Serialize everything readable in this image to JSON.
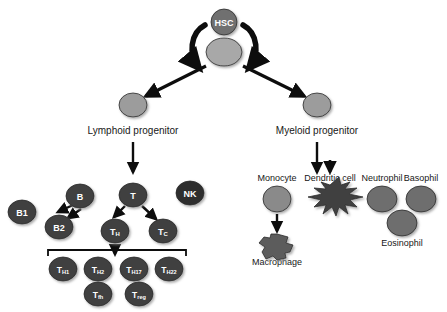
{
  "figure": {
    "background_color": "#ffffff",
    "palette": {
      "stem_gray": "#a8a8a8",
      "progenitor_gray": "#9c9c9c",
      "lymphoid_dark": "#3f3f3f",
      "myeloid_gray": "#8a8a8a",
      "granulocyte_gray": "#6e6e6e",
      "arrow_black": "#0d0d0d",
      "label_black": "#171717"
    }
  },
  "stem": {
    "hsc_label": "HSC",
    "hsc_badge": {
      "cx": 224,
      "cy": 22,
      "r": 13,
      "fill": "#6f6f6f",
      "text_fill": "#ffffff",
      "font_size": 9
    },
    "hsc_cell": {
      "cx": 224,
      "cy": 52,
      "rx": 18,
      "ry": 14,
      "fill": "#a8a8a8"
    },
    "self_renewal_arcs": [
      {
        "name": "self-renewal-arc-left",
        "d": "M 205 25 C 190 33, 188 55, 199 68"
      },
      {
        "name": "self-renewal-arc-right",
        "d": "M 243 25 C 258 33, 260 55, 249 68"
      }
    ]
  },
  "progenitors": [
    {
      "id": "lymphoid",
      "label": "Lymphoid progenitor",
      "cell": {
        "cx": 133,
        "cy": 105,
        "rx": 14,
        "ry": 12,
        "fill": "#9c9c9c"
      },
      "label_pos": {
        "x": 133,
        "y": 130,
        "font_size": 10
      },
      "feed_arrow": {
        "x1": 206,
        "y1": 66,
        "x2": 146,
        "y2": 96
      },
      "down_arrow": {
        "x1": 133,
        "y1": 142,
        "x2": 133,
        "y2": 172
      }
    },
    {
      "id": "myeloid",
      "label": "Myeloid progenitor",
      "cell": {
        "cx": 317,
        "cy": 105,
        "rx": 14,
        "ry": 12,
        "fill": "#9c9c9c"
      },
      "label_pos": {
        "x": 317,
        "y": 130,
        "font_size": 10
      },
      "feed_arrow": {
        "x1": 243,
        "y1": 66,
        "x2": 304,
        "y2": 96
      },
      "down_arrow": {
        "x1": 317,
        "y1": 142,
        "x2": 317,
        "y2": 172
      }
    }
  ],
  "lymphoid_cells": [
    {
      "id": "b1",
      "label": "B1",
      "sub": "",
      "cx": 22,
      "cy": 212,
      "rx": 14,
      "ry": 12,
      "fill": "#3f3f3f",
      "font_size": 9,
      "text_class": "light-text"
    },
    {
      "id": "b2",
      "label": "B2",
      "sub": "",
      "cx": 59,
      "cy": 227,
      "rx": 14,
      "ry": 12,
      "fill": "#3f3f3f",
      "font_size": 9,
      "text_class": "light-text"
    },
    {
      "id": "b",
      "label": "B",
      "sub": "",
      "cx": 80,
      "cy": 196,
      "rx": 14,
      "ry": 12,
      "fill": "#3f3f3f",
      "font_size": 9,
      "text_class": "light-text"
    },
    {
      "id": "t",
      "label": "T",
      "sub": "",
      "cx": 133,
      "cy": 195,
      "rx": 14,
      "ry": 12,
      "fill": "#3f3f3f",
      "font_size": 9,
      "text_class": "light-text"
    },
    {
      "id": "nk",
      "label": "NK",
      "sub": "",
      "cx": 190,
      "cy": 193,
      "rx": 14,
      "ry": 12,
      "fill": "#2f2f2f",
      "font_size": 9,
      "text_class": "light-text"
    },
    {
      "id": "th",
      "label": "T",
      "sub": "H",
      "cx": 115,
      "cy": 231,
      "rx": 14,
      "ry": 12,
      "fill": "#3f3f3f",
      "font_size": 9,
      "text_class": "light-text"
    },
    {
      "id": "tc",
      "label": "T",
      "sub": "C",
      "cx": 163,
      "cy": 231,
      "rx": 14,
      "ry": 12,
      "fill": "#3f3f3f",
      "font_size": 9,
      "text_class": "light-text"
    }
  ],
  "th_subsets": [
    {
      "id": "th1",
      "label": "T",
      "sub": "H1",
      "cx": 63,
      "cy": 269,
      "rx": 14,
      "ry": 12,
      "fill": "#3f3f3f",
      "font_size": 8.5,
      "text_class": "light-text"
    },
    {
      "id": "th2",
      "label": "T",
      "sub": "H2",
      "cx": 98,
      "cy": 269,
      "rx": 14,
      "ry": 12,
      "fill": "#3f3f3f",
      "font_size": 8.5,
      "text_class": "light-text"
    },
    {
      "id": "th17",
      "label": "T",
      "sub": "H17",
      "cx": 134,
      "cy": 269,
      "rx": 14,
      "ry": 12,
      "fill": "#3f3f3f",
      "font_size": 8.5,
      "text_class": "light-text"
    },
    {
      "id": "th22",
      "label": "T",
      "sub": "H22",
      "cx": 169,
      "cy": 269,
      "rx": 14,
      "ry": 12,
      "fill": "#3f3f3f",
      "font_size": 8.5,
      "text_class": "light-text"
    },
    {
      "id": "tfh",
      "label": "T",
      "sub": "fh",
      "cx": 98,
      "cy": 294,
      "rx": 14,
      "ry": 12,
      "fill": "#3f3f3f",
      "font_size": 8.5,
      "text_class": "light-text"
    },
    {
      "id": "treg",
      "label": "T",
      "sub": "reg",
      "cx": 139,
      "cy": 294,
      "rx": 14,
      "ry": 12,
      "fill": "#3f3f3f",
      "font_size": 8.5,
      "text_class": "light-text"
    }
  ],
  "th_bracket": {
    "x1": 48,
    "x2": 186,
    "y": 250,
    "tick_height": 6
  },
  "lymphoid_arrows": [
    {
      "name": "arrow-b-to-b2-upper",
      "x1": 73,
      "y1": 205,
      "x2": 58,
      "y2": 212
    },
    {
      "name": "arrow-b-to-b2-lower",
      "x1": 81,
      "y1": 209,
      "x2": 68,
      "y2": 218
    },
    {
      "name": "arrow-t-to-th",
      "x1": 125,
      "y1": 206,
      "x2": 114,
      "y2": 217
    },
    {
      "name": "arrow-t-to-tc",
      "x1": 142,
      "y1": 206,
      "x2": 156,
      "y2": 219
    },
    {
      "name": "arrow-th-to-subsets",
      "x1": 115,
      "y1": 244,
      "x2": 115,
      "y2": 254
    }
  ],
  "myeloid_groups": [
    {
      "id": "monocyte",
      "label": "Monocyte",
      "label_pos": {
        "x": 277,
        "y": 178,
        "font_size": 9
      },
      "cell": {
        "cx": 277,
        "cy": 199,
        "rx": 14,
        "ry": 13,
        "fill": "#8a8a8a"
      },
      "arrow": {
        "x1": 277,
        "y1": 214,
        "x2": 277,
        "y2": 231
      },
      "child": {
        "label": "Macrophage",
        "label_pos": {
          "x": 277,
          "y": 262,
          "font_size": 9
        }
      }
    },
    {
      "id": "dendritic",
      "label": "Dendritic cell",
      "label_pos": {
        "x": 330,
        "y": 178,
        "font_size": 9
      },
      "feed_arrow": {
        "x1": 330,
        "y1": 160,
        "x2": 330,
        "y2": 172
      }
    },
    {
      "id": "neutrophil",
      "label": "Neutrophil",
      "label_pos": {
        "x": 382,
        "y": 178,
        "font_size": 9
      },
      "cell": {
        "cx": 382,
        "cy": 199,
        "rx": 15,
        "ry": 13,
        "fill": "#6e6e6e"
      }
    },
    {
      "id": "basophil",
      "label": "Basophil",
      "label_pos": {
        "x": 421,
        "y": 178,
        "font_size": 9
      },
      "cell": {
        "cx": 421,
        "cy": 199,
        "rx": 15,
        "ry": 13,
        "fill": "#6e6e6e"
      }
    },
    {
      "id": "eosinophil",
      "label": "Eosinophil",
      "label_pos": {
        "x": 402,
        "y": 243,
        "font_size": 9
      },
      "cell": {
        "cx": 402,
        "cy": 223,
        "rx": 15,
        "ry": 13,
        "fill": "#6e6e6e"
      }
    }
  ],
  "shapes": {
    "dendritic_path": "M 330 185 l -9 -3 l 5 7 l -12 -1 l 8 6 l -14 3 l 13 3 l -7 7 l 12 -2 l -3 9 l 9 -7 l 4 9 l 3 -9 l 9 7 l -3 -9 l 12 2 l -7 -7 l 13 -3 l -14 -3 l 8 -6 l -12 1 l 5 -7 l -9 3 l -2 -8 z",
    "macrophage_path": "M 277 234 l 11 3 l -2 6 l 7 2 l -3 7 l -5 1 l 1 5 l -9 2 l -4 -4 l -7 3 l -4 -7 l 3 -5 l -6 -4 l 5 -6 l 6 1 l 1 -4 z"
  }
}
